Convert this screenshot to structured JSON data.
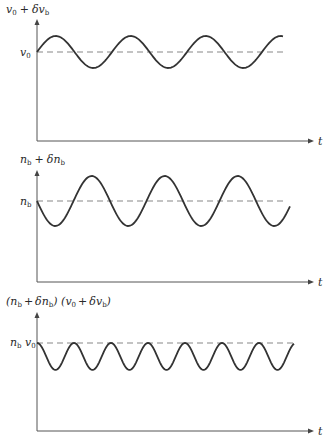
{
  "figure": {
    "panels": [
      {
        "id": "velocity",
        "ylabel": "v₀ + δv_b",
        "ylabel_parts": [
          "v",
          "0",
          " + δv",
          "b"
        ],
        "baseline_label": "v₀",
        "xlabel": "t",
        "waveform": {
          "type": "sine",
          "phase": "rising-from-baseline",
          "period_px": 75,
          "amplitude_px": 16,
          "cycles_shown": 3.3
        }
      },
      {
        "id": "density",
        "ylabel": "n_b + δn_b",
        "baseline_label": "n_b",
        "xlabel": "t",
        "waveform": {
          "type": "sine",
          "phase": "falling-from-baseline",
          "period_px": 73,
          "amplitude_px": 25,
          "cycles_shown": 3.5
        }
      },
      {
        "id": "product",
        "ylabel": "(n_b + δn_b) (v₀ + δv_b)",
        "baseline_label": "n_b v₀",
        "xlabel": "t",
        "waveform": {
          "type": "sine-below-baseline",
          "phase": "peak-at-baseline",
          "period_px": 37,
          "amplitude_px": 27,
          "cycles_shown": 7
        }
      }
    ]
  },
  "labels": {
    "p1_y": [
      "v",
      "0",
      "+",
      "δv",
      "b"
    ],
    "p1_base": [
      "v",
      "0"
    ],
    "p2_y": [
      "n",
      "b",
      "+",
      "δn",
      "b"
    ],
    "p2_base": [
      "n",
      "b"
    ],
    "p3_y": [
      "(n",
      "b",
      "+",
      "δn",
      "b",
      ") (v",
      "0",
      "+",
      "δv",
      "b",
      ")"
    ],
    "p3_base": [
      "n",
      "b",
      " v",
      "0"
    ],
    "t": "t"
  }
}
